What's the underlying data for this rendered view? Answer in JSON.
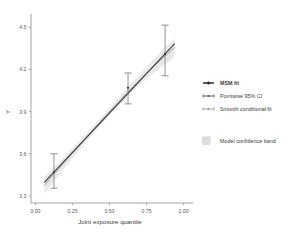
{
  "chart_data": {
    "type": "scatter",
    "title": "",
    "subtitle": "",
    "xlabel": "Joint exposure quantile",
    "ylabel": "Y",
    "xlim": [
      -0.03,
      1.05
    ],
    "ylim": [
      3.25,
      4.58
    ],
    "xticks": [
      "0.00",
      "0.25",
      "0.50",
      "0.75",
      "1.00"
    ],
    "xtick_values": [
      0.0,
      0.25,
      0.5,
      0.75,
      1.0
    ],
    "yticks": [
      "3.3",
      "3.6",
      "3.9",
      "4.2",
      "4.5"
    ],
    "ytick_values": [
      3.3,
      3.6,
      3.9,
      4.2,
      4.5
    ],
    "grid": false,
    "legend_position": "right",
    "series": [
      {
        "name": "MSM fit",
        "type": "line-with-points-and-errorbars",
        "color": "#333333",
        "x": [
          0.125,
          0.625,
          0.875
        ],
        "y": [
          3.47,
          4.07,
          4.31
        ],
        "y_lower": [
          3.355,
          3.955,
          4.155
        ],
        "y_upper": [
          3.6,
          4.175,
          4.515
        ]
      },
      {
        "name": "Smooth conditional fit",
        "type": "line",
        "color": "#7f7f7f",
        "x": [
          0.06,
          0.2,
          0.35,
          0.5,
          0.65,
          0.8,
          0.94
        ],
        "y": [
          3.375,
          3.545,
          3.725,
          3.9,
          4.07,
          4.225,
          4.355
        ]
      },
      {
        "name": "Model confidence band",
        "type": "ribbon",
        "color": "#d8d8d8",
        "x": [
          0.06,
          0.2,
          0.35,
          0.5,
          0.65,
          0.8,
          0.94
        ],
        "y_lower": [
          3.315,
          3.505,
          3.697,
          3.877,
          4.038,
          4.178,
          4.288
        ],
        "y_upper": [
          3.435,
          3.585,
          3.753,
          3.923,
          4.102,
          4.272,
          4.422
        ]
      }
    ],
    "legend_entries": [
      {
        "label": "MSM fit",
        "marker": "line-solid-point",
        "color": "#2b2b2b",
        "weight": "bold"
      },
      {
        "label": "Pointwise 95% CI",
        "marker": "line-errorbar",
        "color": "#555555",
        "weight": "normal"
      },
      {
        "label": "Smooth conditional fit",
        "marker": "line-thin",
        "color": "#8a8a8a",
        "weight": "normal"
      },
      {
        "label": "Model confidence band",
        "marker": "filled-square",
        "color": "#dcdcdc",
        "weight": "normal"
      }
    ],
    "annotations": []
  },
  "figure": {
    "background_color": "#ffffff",
    "axis_color": "#8c8c8c",
    "text_color": "#3c3c3c"
  }
}
